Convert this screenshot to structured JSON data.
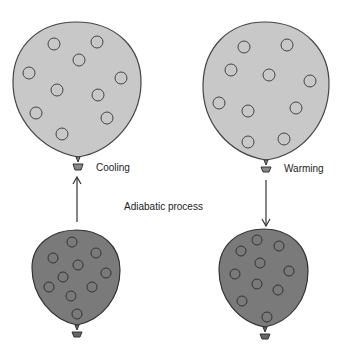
{
  "diagram": {
    "title": "Adiabatic process",
    "colors": {
      "expanded_fill": "#c8c8c8",
      "compressed_fill": "#7a7a7a",
      "outline": "#444444",
      "background": "#ffffff"
    },
    "balloons": [
      {
        "id": "top-left",
        "label": "Cooling",
        "state": "expanded"
      },
      {
        "id": "top-right",
        "label": "Warming",
        "state": "expanded"
      },
      {
        "id": "bottom-left",
        "label": "",
        "state": "compressed"
      },
      {
        "id": "bottom-right",
        "label": "",
        "state": "compressed"
      }
    ],
    "arrows": [
      {
        "id": "left-arrow",
        "direction": "up"
      },
      {
        "id": "right-arrow",
        "direction": "down"
      }
    ]
  }
}
